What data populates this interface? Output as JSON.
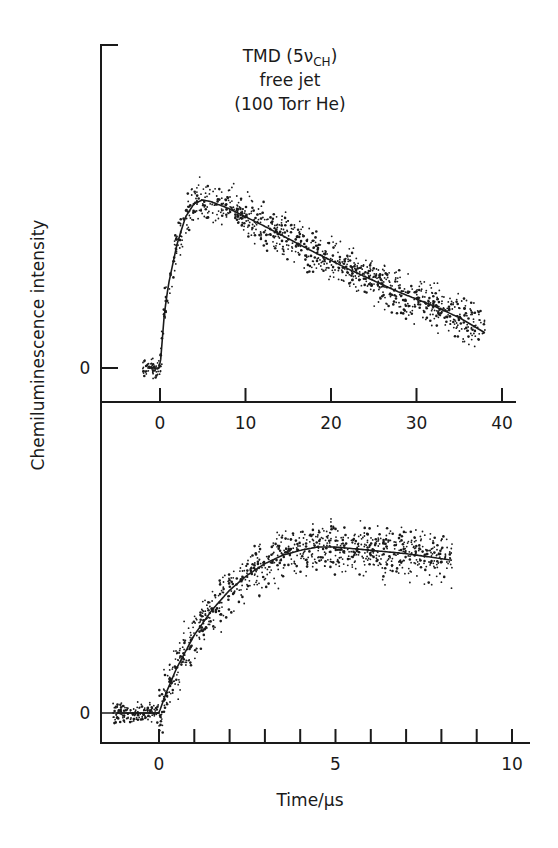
{
  "chart_data": [
    {
      "type": "scatter",
      "panel": "top",
      "title": "TMD (5ν_CH) free jet (100 Torr He)",
      "title_lines": [
        "TMD (5ν",
        "CH",
        ")",
        "free jet",
        "(100 Torr He)"
      ],
      "xlabel": "",
      "ylabel": "Chemiluminescence intensity",
      "xlim": [
        -5,
        42
      ],
      "xticks": [
        0,
        10,
        20,
        30,
        40
      ],
      "xtick_labels": [
        "0",
        "10",
        "20",
        "30",
        "40"
      ],
      "ytick_labels": [
        "0"
      ],
      "grid": false,
      "series": [
        {
          "name": "fit",
          "kind": "line",
          "x": [
            -1.5,
            0,
            0.5,
            1,
            2,
            3,
            4,
            5,
            6,
            8,
            10,
            12,
            15,
            18,
            20,
            22,
            25,
            28,
            30,
            32,
            35,
            38
          ],
          "y": [
            0,
            0,
            0.32,
            0.5,
            0.74,
            0.9,
            0.98,
            1.0,
            0.99,
            0.95,
            0.9,
            0.85,
            0.77,
            0.69,
            0.64,
            0.59,
            0.52,
            0.45,
            0.41,
            0.37,
            0.3,
            0.21
          ]
        },
        {
          "name": "data",
          "kind": "scatter",
          "x_range": [
            -2,
            38
          ],
          "noise": 0.1
        }
      ],
      "y_units": "arbitrary (normalized to peak = 1)"
    },
    {
      "type": "scatter",
      "panel": "bottom",
      "title": "",
      "xlabel": "Time/μs",
      "ylabel": "Chemiluminescence intensity",
      "xlim": [
        -1.6,
        10.2
      ],
      "xticks": [
        0,
        1,
        2,
        3,
        4,
        5,
        6,
        7,
        8,
        9,
        10
      ],
      "xtick_labels": [
        "0",
        "",
        "",
        "",
        "",
        "5",
        "",
        "",
        "",
        "",
        "10"
      ],
      "ytick_labels": [
        "0"
      ],
      "grid": false,
      "series": [
        {
          "name": "fit",
          "kind": "line",
          "x": [
            -1.2,
            0,
            0.2,
            0.5,
            1,
            1.5,
            2,
            2.5,
            3,
            3.5,
            4,
            4.5,
            5,
            6,
            7,
            8,
            8.3
          ],
          "y": [
            0,
            0,
            0.12,
            0.27,
            0.47,
            0.62,
            0.74,
            0.83,
            0.9,
            0.95,
            0.98,
            1.0,
            1.0,
            0.98,
            0.96,
            0.93,
            0.92
          ]
        },
        {
          "name": "data",
          "kind": "scatter",
          "x_range": [
            -1.3,
            8.3
          ],
          "noise": 0.12
        }
      ],
      "y_units": "arbitrary (normalized to plateau = 1)"
    }
  ],
  "labels": {
    "title_main": "TMD (5ν",
    "title_sub": "CH",
    "title_close": ")",
    "title_line2": "free jet",
    "title_line3": "(100 Torr He)",
    "ylabel": "Chemiluminescence intensity",
    "xlabel": "Time/μs",
    "top_zero": "0",
    "bottom_zero": "0"
  },
  "colors": {
    "ink": "#1a1a1a",
    "background": "#ffffff"
  }
}
